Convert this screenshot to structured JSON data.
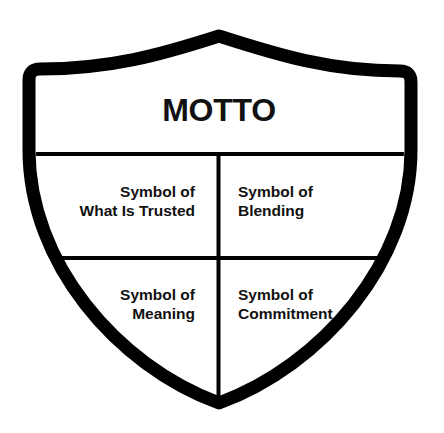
{
  "diagram": {
    "type": "shield-template",
    "colors": {
      "stroke": "#000000",
      "fill": "#ffffff",
      "text": "#111111"
    },
    "motto": {
      "label": "MOTTO"
    },
    "quadrants": [
      {
        "position": "upper-left",
        "line1": "Symbol of",
        "line2": "What Is Trusted"
      },
      {
        "position": "upper-right",
        "line1": "Symbol of",
        "line2": "Blending"
      },
      {
        "position": "lower-left",
        "line1": "Symbol of",
        "line2": "Meaning"
      },
      {
        "position": "lower-right",
        "line1": "Symbol of",
        "line2": "Commitment"
      }
    ]
  }
}
